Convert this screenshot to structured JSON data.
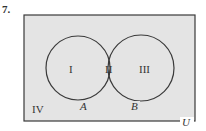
{
  "problem": {
    "number": "7."
  },
  "diagram": {
    "type": "venn",
    "universe_label": "U",
    "sets": [
      "A",
      "B"
    ],
    "regions": [
      "I",
      "II",
      "III",
      "IV"
    ],
    "shaded_regions": [
      "I",
      "III",
      "IV"
    ],
    "unshaded_regions": [
      "II"
    ],
    "colors": {
      "shade": "#e4e4e4",
      "line": "#3a3a3a",
      "unshaded": "#ffffff"
    }
  }
}
